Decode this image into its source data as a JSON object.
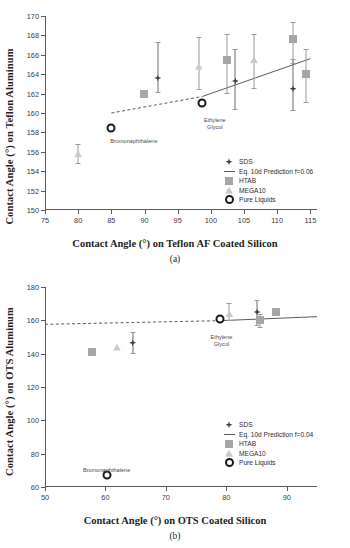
{
  "figure": {
    "panels": [
      {
        "caption": "(a)",
        "xlabel": "Contact Angle (°) on Teflon AF Coated Silicon",
        "ylabel": "Contact Angle (°) on Teflon Aluminum",
        "xticks": [
          "75",
          "80",
          "85",
          "90",
          "95",
          "100",
          "105",
          "110",
          "115"
        ],
        "yticks": [
          "150",
          "152",
          "154",
          "156",
          "158",
          "160",
          "162",
          "164",
          "166",
          "168",
          "170"
        ],
        "legend": [
          {
            "label": "SDS",
            "marker": "diamond",
            "color": "#3d3d46"
          },
          {
            "label": "Eq. 10d Prediction f=0.06",
            "marker": "line",
            "color": "#5a5a5a"
          },
          {
            "label": "HTAB",
            "marker": "square",
            "color": "#a6a6a6"
          },
          {
            "label": "MEGA10",
            "marker": "triangle",
            "color": "#c9c9c9"
          },
          {
            "label": "Pure Liquids",
            "marker": "circle-open",
            "color": "#1a1a1a"
          }
        ],
        "annotations": [
          {
            "text": "Bromonaphthalene",
            "x": 88.4,
            "y": 157.4
          },
          {
            "text": "Ethylene\nGlycol",
            "x": 100.6,
            "y": 159.6
          }
        ]
      },
      {
        "caption": "(b)",
        "xlabel": "Contact Angle (°) on OTS Coated Silicon",
        "ylabel": "Contact Angle (°) on OTS Aluminum",
        "xticks": [
          "50",
          "60",
          "70",
          "80",
          "90"
        ],
        "yticks": [
          "60",
          "80",
          "100",
          "120",
          "140",
          "160",
          "180"
        ],
        "legend": [
          {
            "label": "SDS",
            "marker": "diamond",
            "color": "#3d3d46"
          },
          {
            "label": "Eq. 10d Prediction f=0.04",
            "marker": "line",
            "color": "#5a5a5a"
          },
          {
            "label": "HTAB",
            "marker": "square",
            "color": "#a6a6a6"
          },
          {
            "label": "MEGA10",
            "marker": "triangle",
            "color": "#c9c9c9"
          },
          {
            "label": "Pure Liquids",
            "marker": "circle-open",
            "color": "#1a1a1a"
          }
        ],
        "annotations": [
          {
            "text": "Bromonaphthalene",
            "x": 60.2,
            "y": 72.0
          },
          {
            "text": "Ethylene\nGlycol",
            "x": 79.2,
            "y": 152.0
          }
        ]
      }
    ]
  },
  "chart_data": [
    {
      "type": "scatter",
      "title": "",
      "panel": "(a)",
      "xlabel": "Contact Angle (°) on Teflon AF Coated Silicon",
      "ylabel": "Contact Angle (°) on Teflon Aluminum",
      "xlim": [
        75,
        116
      ],
      "ylim": [
        150,
        170
      ],
      "xticks": [
        75,
        80,
        85,
        90,
        95,
        100,
        105,
        110,
        115
      ],
      "yticks": [
        150,
        152,
        154,
        156,
        158,
        160,
        162,
        164,
        166,
        168,
        170
      ],
      "grid": false,
      "legend_position": "inside-bottom-right",
      "series": [
        {
          "name": "SDS",
          "marker": "diamond",
          "color": "#3d3d46",
          "points": [
            {
              "x": 92.0,
              "y": 163.6,
              "yerr_low": 162.2,
              "yerr_high": 167.3
            },
            {
              "x": 103.7,
              "y": 163.3,
              "yerr_low": 160.4,
              "yerr_high": 166.6
            },
            {
              "x": 112.4,
              "y": 162.5,
              "yerr_low": 160.3,
              "yerr_high": 165.6
            }
          ]
        },
        {
          "name": "HTAB",
          "marker": "square",
          "color": "#a6a6a6",
          "points": [
            {
              "x": 89.9,
              "y": 162.0,
              "yerr_low": 162.0,
              "yerr_high": 162.0
            },
            {
              "x": 102.4,
              "y": 165.5,
              "yerr_low": 162.1,
              "yerr_high": 168.1
            },
            {
              "x": 112.4,
              "y": 167.6,
              "yerr_low": 165.2,
              "yerr_high": 169.4
            },
            {
              "x": 114.3,
              "y": 164.0,
              "yerr_low": 161.1,
              "yerr_high": 166.6
            }
          ]
        },
        {
          "name": "MEGA10",
          "marker": "triangle",
          "color": "#c9c9c9",
          "points": [
            {
              "x": 80.0,
              "y": 155.8,
              "yerr_low": 154.8,
              "yerr_high": 156.8
            },
            {
              "x": 98.2,
              "y": 164.8,
              "yerr_low": 162.5,
              "yerr_high": 167.8
            },
            {
              "x": 106.5,
              "y": 165.5,
              "yerr_low": 162.6,
              "yerr_high": 168.1
            }
          ]
        },
        {
          "name": "Pure Liquids",
          "marker": "circle-open",
          "color": "#1a1a1a",
          "points": [
            {
              "x": 85.0,
              "y": 158.5,
              "label": "Bromonaphthalene"
            },
            {
              "x": 98.7,
              "y": 161.0,
              "label": "Ethylene Glycol"
            }
          ]
        }
      ],
      "lines": [
        {
          "name": "Eq. 10d Prediction f=0.06",
          "style": "dashed",
          "color": "#5a5a5a",
          "x": [
            85.0,
            98.7
          ],
          "y": [
            160.0,
            161.7
          ]
        },
        {
          "name": "Eq. 10d Prediction f=0.06",
          "style": "solid",
          "color": "#5a5a5a",
          "x": [
            98.7,
            115.0
          ],
          "y": [
            161.7,
            165.6
          ]
        }
      ]
    },
    {
      "type": "scatter",
      "title": "",
      "panel": "(b)",
      "xlabel": "Contact Angle (°) on OTS Coated Silicon",
      "ylabel": "Contact Angle (°) on OTS Aluminum",
      "xlim": [
        50,
        95
      ],
      "ylim": [
        60,
        180
      ],
      "xticks": [
        50,
        60,
        70,
        80,
        90
      ],
      "yticks": [
        60,
        80,
        100,
        120,
        140,
        160,
        180
      ],
      "grid": false,
      "legend_position": "inside-bottom-right",
      "series": [
        {
          "name": "SDS",
          "marker": "diamond",
          "color": "#3d3d46",
          "points": [
            {
              "x": 64.5,
              "y": 146.6,
              "yerr_low": 140.5,
              "yerr_high": 153.0
            },
            {
              "x": 85.1,
              "y": 165.0,
              "yerr_low": 157.5,
              "yerr_high": 172.5
            }
          ]
        },
        {
          "name": "HTAB",
          "marker": "square",
          "color": "#a6a6a6",
          "points": [
            {
              "x": 57.8,
              "y": 140.8,
              "yerr_low": 140.8,
              "yerr_high": 140.8
            },
            {
              "x": 85.6,
              "y": 160.5,
              "yerr_low": 156.0,
              "yerr_high": 164.0
            },
            {
              "x": 88.2,
              "y": 164.8,
              "yerr_low": 164.8,
              "yerr_high": 164.8
            }
          ]
        },
        {
          "name": "MEGA10",
          "marker": "triangle",
          "color": "#c9c9c9",
          "points": [
            {
              "x": 61.9,
              "y": 143.8,
              "yerr_low": 143.8,
              "yerr_high": 143.8
            },
            {
              "x": 80.5,
              "y": 164.0,
              "yerr_low": 160.0,
              "yerr_high": 170.5
            }
          ]
        },
        {
          "name": "Pure Liquids",
          "marker": "circle-open",
          "color": "#1a1a1a",
          "points": [
            {
              "x": 60.3,
              "y": 67.0,
              "label": "Bromonaphthalene"
            },
            {
              "x": 79.0,
              "y": 161.0,
              "label": "Ethylene Glycol"
            }
          ]
        }
      ],
      "lines": [
        {
          "name": "Eq. 10d Prediction f=0.04",
          "style": "dashed",
          "color": "#5a5a5a",
          "x": [
            50.0,
            79.0
          ],
          "y": [
            157.6,
            159.8
          ]
        },
        {
          "name": "Eq. 10d Prediction f=0.04",
          "style": "solid",
          "color": "#5a5a5a",
          "x": [
            79.0,
            95.0
          ],
          "y": [
            159.8,
            162.2
          ]
        }
      ]
    }
  ]
}
